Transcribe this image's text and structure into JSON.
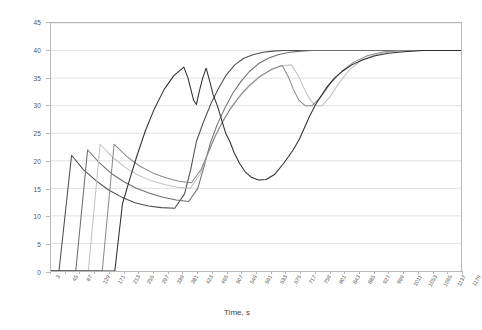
{
  "chart_data": {
    "type": "line",
    "title": "",
    "xlabel": "Time, s",
    "ylabel": "Speed, m/s",
    "xlim": [
      3,
      1179
    ],
    "ylim": [
      0,
      45
    ],
    "y_ticks": [
      0,
      5,
      10,
      15,
      20,
      25,
      30,
      35,
      40,
      45
    ],
    "x_ticks": [
      3,
      45,
      87,
      129,
      171,
      213,
      255,
      297,
      339,
      381,
      423,
      465,
      507,
      549,
      591,
      633,
      675,
      717,
      759,
      801,
      843,
      885,
      927,
      969,
      1011,
      1053,
      1095,
      1137,
      1179
    ],
    "grid": "horizontal",
    "legend": "none",
    "series": [
      {
        "name": "Vehicle 1",
        "color": "#4d4d4d",
        "x": [
          3,
          26,
          62,
          96,
          132,
          168,
          206,
          244,
          282,
          320,
          358,
          386,
          404,
          420,
          440,
          462,
          484,
          506,
          530,
          556,
          584,
          612,
          640,
          668,
          700,
          732,
          764,
          800,
          840,
          880,
          930,
          980,
          1040,
          1100,
          1179
        ],
        "y": [
          0,
          0,
          21,
          18.4,
          16.4,
          14.7,
          13.4,
          12.4,
          11.8,
          11.5,
          11.4,
          14,
          18.5,
          23.5,
          27,
          30.4,
          33.2,
          35.6,
          37.4,
          38.6,
          39.3,
          39.7,
          39.9,
          40,
          40,
          40,
          40,
          40,
          40,
          40,
          40,
          40,
          40,
          40,
          40
        ]
      },
      {
        "name": "Vehicle 2",
        "color": "#6e6e6e",
        "x": [
          3,
          74,
          108,
          142,
          176,
          212,
          248,
          286,
          324,
          362,
          398,
          424,
          442,
          460,
          480,
          502,
          524,
          548,
          572,
          598,
          626,
          656,
          688,
          720,
          752,
          786,
          822,
          860,
          900,
          945,
          995,
          1050,
          1110,
          1179
        ],
        "y": [
          0,
          0,
          22,
          19.6,
          17.7,
          16.2,
          15,
          14.1,
          13.4,
          12.9,
          12.6,
          15,
          19,
          23.2,
          26.6,
          29.6,
          32.2,
          34.4,
          36.2,
          37.6,
          38.6,
          39.3,
          39.7,
          39.9,
          40,
          40,
          40,
          40,
          40,
          40,
          40,
          40,
          40,
          40
        ]
      },
      {
        "name": "Vehicle 3",
        "color": "#c2c2c2",
        "x": [
          3,
          110,
          144,
          180,
          216,
          252,
          290,
          328,
          366,
          402,
          430,
          448,
          468,
          490,
          514,
          540,
          568,
          598,
          628,
          660,
          692,
          712,
          726,
          742,
          760,
          780,
          802,
          828,
          856,
          890,
          930,
          975,
          1030,
          1090,
          1179
        ],
        "y": [
          0,
          0,
          23,
          20.6,
          18.8,
          17.4,
          16.4,
          15.7,
          15.2,
          15,
          17.5,
          20.5,
          23.6,
          26.4,
          29,
          31.3,
          33.3,
          35,
          36.3,
          37.2,
          37.4,
          35.5,
          33.5,
          31.5,
          30,
          30,
          31.5,
          34,
          36.3,
          38.1,
          39.2,
          39.8,
          40,
          40,
          40
        ]
      },
      {
        "name": "Vehicle 4",
        "color": "#8a8a8a",
        "x": [
          3,
          150,
          184,
          220,
          256,
          294,
          332,
          370,
          406,
          434,
          454,
          474,
          496,
          520,
          546,
          574,
          604,
          636,
          666,
          684,
          698,
          714,
          732,
          752,
          776,
          804,
          836,
          872,
          912,
          958,
          1010,
          1070,
          1130,
          1179
        ],
        "y": [
          0,
          0,
          23,
          20.8,
          19.1,
          17.8,
          16.9,
          16.3,
          16,
          18.5,
          21.5,
          24.5,
          27.2,
          29.7,
          31.9,
          33.8,
          35.4,
          36.6,
          37.3,
          35.2,
          33,
          31,
          30,
          30,
          31.5,
          34,
          36.2,
          37.9,
          39.1,
          39.8,
          40,
          40,
          40,
          40
        ]
      },
      {
        "name": "Vehicle 5",
        "color": "#2f2f2f",
        "x": [
          3,
          186,
          208,
          228,
          250,
          274,
          300,
          328,
          356,
          384,
          396,
          404,
          412,
          420,
          428,
          438,
          448,
          458,
          468,
          480,
          492,
          504,
          516,
          528,
          544,
          560,
          578,
          598,
          620,
          644,
          670,
          698,
          716,
          730,
          744,
          760,
          778,
          796,
          816,
          840,
          866,
          896,
          930,
          970,
          1015,
          1070,
          1130,
          1179
        ],
        "y": [
          0,
          0,
          12.2,
          16.5,
          21,
          25.5,
          29.5,
          33,
          35.5,
          37,
          35,
          33,
          31,
          30.2,
          32.5,
          35,
          36.8,
          34.5,
          32,
          30,
          27.5,
          25,
          23.5,
          21.5,
          19.5,
          18,
          17,
          16.5,
          16.6,
          17.5,
          19.5,
          22,
          24,
          26,
          28,
          30,
          31.8,
          33.5,
          35,
          36.3,
          37.4,
          38.3,
          39,
          39.5,
          39.8,
          40,
          40,
          40
        ]
      }
    ]
  }
}
